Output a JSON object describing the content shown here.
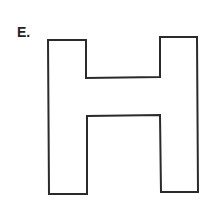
{
  "figure": {
    "label": "E.",
    "shape_name": "letter H outline",
    "stroke_color": "#2a2a2a",
    "background_color": "#ffffff"
  }
}
